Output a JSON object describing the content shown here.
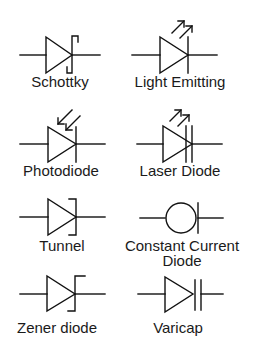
{
  "diagram": {
    "title": "",
    "colors": {
      "stroke": "#111111",
      "text": "#1a1a1a",
      "background": "#ffffff"
    },
    "symbols": [
      {
        "id": "schottky",
        "label": "Schottky",
        "icon": "schottky-diode-icon"
      },
      {
        "id": "led",
        "label": "Light Emitting",
        "icon": "led-icon"
      },
      {
        "id": "photodiode",
        "label": "Photodiode",
        "icon": "photodiode-icon"
      },
      {
        "id": "laser",
        "label": "Laser Diode",
        "icon": "laser-diode-icon"
      },
      {
        "id": "tunnel",
        "label": "Tunnel",
        "icon": "tunnel-diode-icon"
      },
      {
        "id": "constant_current",
        "label": "Constant Current",
        "label_line2": "Diode",
        "icon": "constant-current-diode-icon"
      },
      {
        "id": "zener",
        "label": "Zener diode",
        "icon": "zener-diode-icon"
      },
      {
        "id": "varicap",
        "label": "Varicap",
        "icon": "varicap-icon"
      }
    ]
  }
}
